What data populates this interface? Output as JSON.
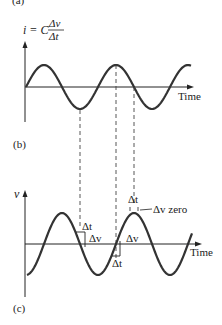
{
  "top_panel": {
    "label": "(b)",
    "axis_title": {
      "prefix": "i = C",
      "numerator": "Δv",
      "denominator": "Δt"
    },
    "x_axis_label": "Time",
    "waveform": "sine",
    "cycles_shown": 2.3
  },
  "bottom_panel": {
    "label": "(c)",
    "y_axis_label": "v",
    "x_axis_label": "Time",
    "waveform": "negative-cosine",
    "annotations": [
      {
        "id": "delta-t-1",
        "text": "Δt"
      },
      {
        "id": "delta-v-1",
        "text": "Δv"
      },
      {
        "id": "delta-v-2",
        "text": "Δv"
      },
      {
        "id": "delta-t-2",
        "text": "Δt"
      },
      {
        "id": "delta-t-3",
        "text": "Δt"
      },
      {
        "id": "delta-v-zero",
        "text": "Δv zero"
      }
    ]
  },
  "top_fragment_label": "(a)",
  "colors": {
    "curve": "#333333",
    "axis": "#222222",
    "dashed": "#444444"
  }
}
